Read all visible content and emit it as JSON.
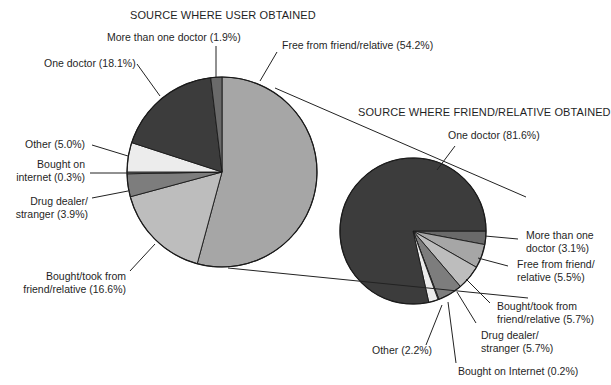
{
  "chart_data": [
    {
      "type": "pie",
      "title": "SOURCE WHERE USER OBTAINED",
      "center": [
        222,
        172
      ],
      "radius": 95,
      "start_angle_deg": 0,
      "direction": "clockwise",
      "slices": [
        {
          "label": "Free from friend/relative",
          "value": 54.2,
          "color": "#a6a6a6"
        },
        {
          "label": "Bought/took from friend/relative",
          "value": 16.6,
          "color": "#bdbdbd"
        },
        {
          "label": "Drug dealer/stranger",
          "value": 3.9,
          "color": "#7d7d7d"
        },
        {
          "label": "Bought on internet",
          "value": 0.3,
          "color": "#9a9a9a"
        },
        {
          "label": "Other",
          "value": 5.0,
          "color": "#ececec"
        },
        {
          "label": "One doctor",
          "value": 18.1,
          "color": "#3c3c3c"
        },
        {
          "label": "More than one doctor",
          "value": 1.9,
          "color": "#6a6a6a"
        }
      ]
    },
    {
      "type": "pie",
      "title": "SOURCE WHERE FRIEND/RELATIVE OBTAINED",
      "center": [
        413,
        231
      ],
      "radius": 73,
      "start_angle_deg": 90,
      "direction": "clockwise",
      "slices": [
        {
          "label": "More than one doctor",
          "value": 3.1,
          "color": "#6a6a6a"
        },
        {
          "label": "Free from friend/relative",
          "value": 5.5,
          "color": "#a6a6a6"
        },
        {
          "label": "Bought/took from friend/relative",
          "value": 5.7,
          "color": "#bdbdbd"
        },
        {
          "label": "Drug dealer/stranger",
          "value": 5.7,
          "color": "#7d7d7d"
        },
        {
          "label": "Bought on Internet",
          "value": 0.2,
          "color": "#9a9a9a"
        },
        {
          "label": "Other",
          "value": 2.2,
          "color": "#ececec"
        },
        {
          "label": "One doctor",
          "value": 81.6,
          "color": "#3c3c3c"
        }
      ]
    }
  ],
  "titles": {
    "left": "SOURCE WHERE USER OBTAINED",
    "right": "SOURCE WHERE FRIEND/RELATIVE OBTAINED"
  },
  "labels_left": {
    "more_than_one": "More than one doctor (1.9%)",
    "one_doctor": "One doctor (18.1%)",
    "free": "Free from friend/relative (54.2%)",
    "other": "Other (5.0%)",
    "internet_1": "Bought on",
    "internet_2": "internet (0.3%)",
    "drug_1": "Drug dealer/",
    "drug_2": "stranger (3.9%)",
    "bought_1": "Bought/took from",
    "bought_2": "friend/relative (16.6%)"
  },
  "labels_right": {
    "one_doctor": "One doctor (81.6%)",
    "more_1": "More than one",
    "more_2": "doctor (3.1%)",
    "free_1": "Free from friend/",
    "free_2": "relative (5.5%)",
    "bought_1": "Bought/took from",
    "bought_2": "friend/relative (5.7%)",
    "drug_1": "Drug dealer/",
    "drug_2": "stranger (5.7%)",
    "other": "Other (2.2%)",
    "internet": "Bought on Internet (0.2%)"
  }
}
